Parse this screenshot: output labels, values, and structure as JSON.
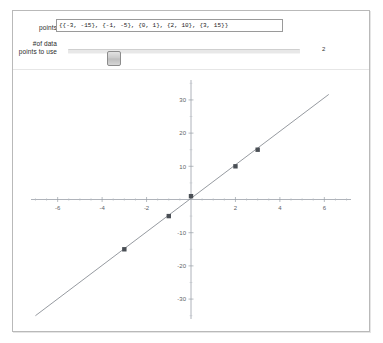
{
  "window": {
    "background": "#ffffff",
    "frame_border_color": "#b9b9b9"
  },
  "controls": {
    "points": {
      "label": "points",
      "value": "{{-3, -15}, {-1, -5}, {0, 1}, {2, 10}, {3, 15}}",
      "placeholder": ""
    },
    "num_points": {
      "label": "#of data points to use",
      "value": "2",
      "min": 2,
      "max": 5,
      "handle_fraction": 0.18
    }
  },
  "chart_data": {
    "type": "scatter",
    "title": "",
    "xlabel": "",
    "ylabel": "",
    "xlim": [
      -7.2,
      7.2
    ],
    "ylim": [
      -36,
      36
    ],
    "grid": false,
    "legend": null,
    "axis_style": "crossed-at-origin",
    "xticks": [
      -6,
      -4,
      -2,
      2,
      4,
      6
    ],
    "xtick_labels": [
      "-6",
      "-4",
      "-2",
      "2",
      "4",
      "6"
    ],
    "yticks": [
      30,
      20,
      10,
      -10,
      -20,
      -30
    ],
    "ytick_labels": [
      "30",
      "20",
      "10",
      "-10",
      "-20",
      "-30"
    ],
    "x": [
      -3,
      -1,
      0,
      2,
      3
    ],
    "y": [
      -15,
      -5,
      1,
      10,
      15
    ],
    "points": [
      {
        "x": -3,
        "y": -15
      },
      {
        "x": -1,
        "y": -5
      },
      {
        "x": 0,
        "y": 1
      },
      {
        "x": 2,
        "y": 10
      },
      {
        "x": 3,
        "y": 15
      }
    ],
    "series": [
      {
        "name": "data points",
        "type": "scatter",
        "marker": "square",
        "color": "#4a4f55",
        "values": [
          -15,
          -5,
          1,
          10,
          15
        ]
      },
      {
        "name": "fit line",
        "type": "line",
        "color": "#8a8f95",
        "slope": 5.05,
        "intercept": 0.35,
        "x_range": [
          -7.0,
          6.2
        ]
      }
    ]
  }
}
